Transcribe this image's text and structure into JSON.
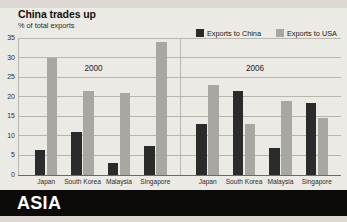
{
  "header": {
    "title": "China trades up",
    "subtitle": "% of total exports"
  },
  "legend": {
    "items": [
      {
        "label": "Exports to China",
        "color": "#2b2b2b",
        "icon": "legend-swatch-icon"
      },
      {
        "label": "Exports to USA",
        "color": "#a9a7a2",
        "icon": "legend-swatch-icon"
      }
    ]
  },
  "footer": {
    "section": "ASIA"
  },
  "chart_data": {
    "type": "bar",
    "title": "China trades up",
    "subtitle": "% of total exports",
    "xlabel": "",
    "ylabel": "% of total exports",
    "ylim": [
      0,
      35
    ],
    "yticks": [
      0,
      5,
      10,
      15,
      20,
      25,
      30,
      35
    ],
    "grid": true,
    "legend_position": "top-right",
    "groups": [
      "2000",
      "2006"
    ],
    "categories": [
      "Japan",
      "South Korea",
      "Malaysia",
      "Singapore"
    ],
    "series": [
      {
        "name": "Exports to China",
        "color": "#2b2b2b",
        "values_2000": [
          6.5,
          11.0,
          3.0,
          7.5
        ],
        "values_2006": [
          13.0,
          21.5,
          7.0,
          18.5
        ]
      },
      {
        "name": "Exports to USA",
        "color": "#a9a7a2",
        "values_2000": [
          30.0,
          21.5,
          21.0,
          34.0
        ],
        "values_2006": [
          23.0,
          13.0,
          19.0,
          14.5
        ]
      }
    ]
  }
}
